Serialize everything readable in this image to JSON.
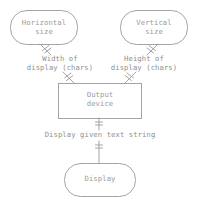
{
  "diagram": {
    "style": {
      "stroke_color": "#9a9a9a",
      "text_color": "#9a9a9a",
      "background_color": "#ffffff"
    },
    "nodes": [
      {
        "id": "horizontal-size",
        "shape": "rounded-rectangle",
        "label": "Horizontal\nsize"
      },
      {
        "id": "vertical-size",
        "shape": "rounded-rectangle",
        "label": "Vertical\nsize"
      },
      {
        "id": "output-device",
        "shape": "rectangle",
        "label": "Output\ndevice"
      },
      {
        "id": "display",
        "shape": "rounded-rectangle",
        "label": "Display"
      }
    ],
    "edges": [
      {
        "id": "width-of-display",
        "from": "horizontal-size",
        "to": "output-device",
        "label": "Width of\ndisplay (chars)"
      },
      {
        "id": "height-of-display",
        "from": "vertical-size",
        "to": "output-device",
        "label": "Height of\ndisplay (chars)"
      },
      {
        "id": "display-given-text-string",
        "from": "output-device",
        "to": "display",
        "label": "Display given text string"
      }
    ]
  }
}
